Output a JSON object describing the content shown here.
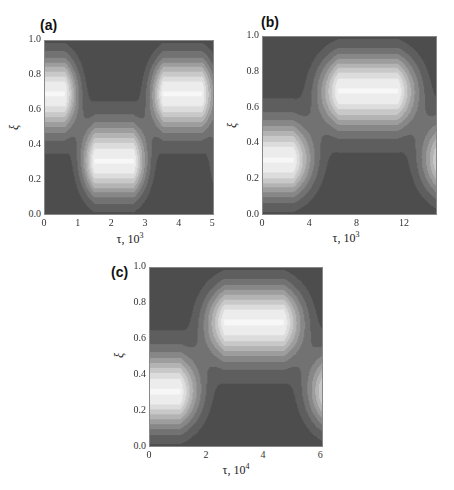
{
  "chart_data": [
    {
      "type": "heatmap",
      "panel": "(a)",
      "title": "(a)",
      "xlabel": "τ, 10³",
      "ylabel": "ξ",
      "xlim": [
        0,
        5.05
      ],
      "ylim": [
        0,
        1
      ],
      "xticks": [
        "0",
        "1",
        "2",
        "3",
        "4",
        "5"
      ],
      "yticks": [
        "0.0",
        "0.2",
        "0.4",
        "0.6",
        "0.8",
        "1.0"
      ],
      "colormap": "grayscale filled contours, dark = low, white = high",
      "maxima": [
        {
          "tau": 0,
          "xi": 0.7
        },
        {
          "tau": 2.1,
          "xi": 0.3
        },
        {
          "tau": 4.15,
          "xi": 0.7
        }
      ],
      "period": 4.15
    },
    {
      "type": "heatmap",
      "panel": "(b)",
      "title": "(b)",
      "xlabel": "τ, 10³",
      "ylabel": "ξ",
      "xlim": [
        0,
        14.8
      ],
      "ylim": [
        0,
        1
      ],
      "xticks": [
        "0",
        "4",
        "8",
        "12"
      ],
      "yticks": [
        "0.0",
        "0.2",
        "0.4",
        "0.6",
        "0.8",
        "1.0"
      ],
      "colormap": "grayscale filled contours, dark = low, white = high",
      "maxima": [
        {
          "tau": 0,
          "xi": 0.3
        },
        {
          "tau": 9.0,
          "xi": 0.7
        },
        {
          "tau": 15.5,
          "xi": 0.3
        }
      ],
      "period": 18.0
    },
    {
      "type": "heatmap",
      "panel": "(c)",
      "title": "(c)",
      "xlabel": "τ, 10⁴",
      "ylabel": "ξ",
      "xlim": [
        0,
        6.1
      ],
      "ylim": [
        0,
        1
      ],
      "xticks": [
        "0",
        "2",
        "4",
        "6"
      ],
      "yticks": [
        "0.0",
        "0.2",
        "0.4",
        "0.6",
        "0.8",
        "1.0"
      ],
      "colormap": "grayscale filled contours, dark = low, white = high",
      "maxima": [
        {
          "tau": 0,
          "xi": 0.3
        },
        {
          "tau": 3.7,
          "xi": 0.7
        },
        {
          "tau": 6.3,
          "xi": 0.3
        }
      ],
      "period": 7.4
    }
  ],
  "panels": {
    "a": {
      "label": "(a)",
      "xlabel": "τ, 10",
      "xexp": "3",
      "ylabel": "ξ"
    },
    "b": {
      "label": "(b)",
      "xlabel": "τ, 10",
      "xexp": "3",
      "ylabel": "ξ"
    },
    "c": {
      "label": "(c)",
      "xlabel": "τ, 10",
      "xexp": "4",
      "ylabel": "ξ"
    }
  },
  "levels": [
    "#4d4d4d",
    "#5e5e5e",
    "#727272",
    "#878787",
    "#9d9d9d",
    "#b3b3b3",
    "#c8c8c8",
    "#dcdcdc",
    "#ececec",
    "#f7f7f7"
  ]
}
